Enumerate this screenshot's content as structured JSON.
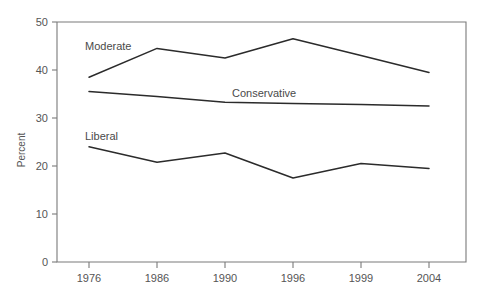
{
  "chart_data": {
    "type": "line",
    "title": "",
    "subtitle": "",
    "xlabel": "",
    "ylabel": "Percent",
    "categories": [
      "1976",
      "1986",
      "1990",
      "1996",
      "1999",
      "2004"
    ],
    "ylim": [
      0,
      50
    ],
    "yticks": [
      "0",
      "10",
      "20",
      "30",
      "40",
      "50"
    ],
    "ytick_values": [
      0,
      10,
      20,
      30,
      40,
      50
    ],
    "grid": false,
    "legend_position": "inline-annotations",
    "series": [
      {
        "name": "Moderate",
        "values": [
          38.5,
          44.5,
          42.5,
          46.5,
          43.0,
          39.5
        ],
        "color": "#2b2b2b",
        "label_x": "1976",
        "label_text": "Moderate"
      },
      {
        "name": "Conservative",
        "values": [
          35.5,
          34.5,
          33.3,
          33.0,
          32.8,
          32.5
        ],
        "color": "#2b2b2b",
        "label_x": "1994",
        "label_text": "Conservative"
      },
      {
        "name": "Liberal",
        "values": [
          24.0,
          20.8,
          22.7,
          17.5,
          20.5,
          19.5
        ],
        "color": "#2b2b2b",
        "label_x": "1976",
        "label_text": "Liberal"
      }
    ],
    "annotations": [
      {
        "text": "Moderate",
        "x_px": 85,
        "y_px": 50
      },
      {
        "text": "Conservative",
        "x_px": 232,
        "y_px": 97
      },
      {
        "text": "Liberal",
        "x_px": 85,
        "y_px": 140
      }
    ]
  },
  "axis": {
    "y_label": "Percent",
    "y_ticks": [
      "50",
      "40",
      "30",
      "20",
      "10",
      "0"
    ],
    "x_ticks": [
      "1976",
      "1986",
      "1990",
      "1996",
      "1999",
      "2004"
    ]
  }
}
